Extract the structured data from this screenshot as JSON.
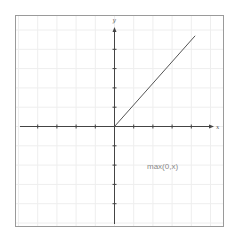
{
  "chart_data": {
    "type": "line",
    "title": "",
    "xlabel": "x",
    "ylabel": "y",
    "annotation": "max(0,x)",
    "xlim": [
      -5,
      5
    ],
    "ylim": [
      -5,
      5
    ],
    "grid": true,
    "ticks_labeled": false,
    "x_ticks": [
      -4,
      -3,
      -2,
      -1,
      1,
      2,
      3,
      4
    ],
    "y_ticks": [
      -4,
      -3,
      -2,
      -1,
      1,
      2,
      3,
      4
    ],
    "series": [
      {
        "name": "max(0,x)",
        "x": [
          0,
          4.2
        ],
        "y": [
          0,
          4.7
        ],
        "color": "#555555"
      }
    ],
    "legend": null
  },
  "labels": {
    "x_axis": "x",
    "y_axis": "y",
    "function": "max(0,x)"
  },
  "colors": {
    "frame": "#9a9a9a",
    "axis": "#444444",
    "grid": "#eeeeee",
    "curve": "#555555",
    "annotation": "#888888"
  }
}
